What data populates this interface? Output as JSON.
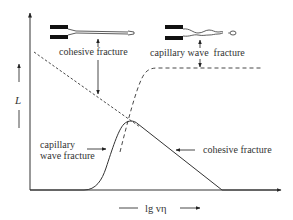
{
  "diagram": {
    "y_axis_label": "L",
    "x_axis_label": "lg vη",
    "top_labels": {
      "cohesive": "cohesive fracture",
      "capillary": "capillary wave  fracture"
    },
    "curve_labels": {
      "capillary_line1": "capillary",
      "capillary_line2": "wave fracture",
      "cohesive": "cohesive fracture"
    },
    "colors": {
      "line": "#333333",
      "fill": "#111111",
      "background": "#ffffff"
    }
  }
}
